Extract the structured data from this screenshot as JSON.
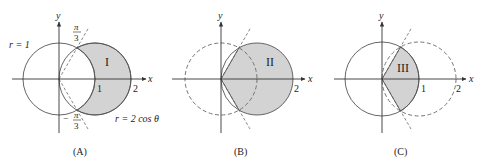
{
  "figure": {
    "panels": [
      {
        "id": "A",
        "caption": "(A)",
        "region_label": "I",
        "axis_x_label": "x",
        "axis_y_label": "y",
        "ticks": [
          "1",
          "2"
        ],
        "curve_labels": {
          "circle": "r = 1",
          "offset_circle": "r = 2 cos θ"
        },
        "angle_labels": {
          "upper_num": "π",
          "upper_den": "3",
          "lower_sign": "−",
          "lower_num": "π",
          "lower_den": "3"
        },
        "shaded_region": "inside r = 2cosθ, outside r = 1"
      },
      {
        "id": "B",
        "caption": "(B)",
        "region_label": "II",
        "axis_x_label": "x",
        "axis_y_label": "y",
        "ticks": [
          "2"
        ],
        "shaded_region": "inside r = 2cosθ for −π/3 ≤ θ ≤ π/3"
      },
      {
        "id": "C",
        "caption": "(C)",
        "region_label": "III",
        "axis_x_label": "x",
        "axis_y_label": "y",
        "ticks": [
          "1",
          "2"
        ],
        "shaded_region": "inside r = 1 for −π/3 ≤ θ ≤ π/3"
      }
    ],
    "colors": {
      "shade": "#d3d3d3",
      "line": "#555555",
      "axis": "#333333"
    }
  }
}
